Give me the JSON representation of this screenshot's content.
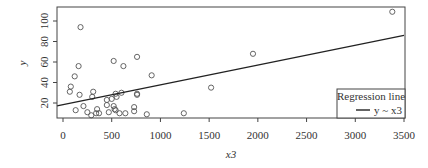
{
  "chart_data": {
    "type": "scatter",
    "title": "",
    "xlabel": "x3",
    "ylabel": "y",
    "xlim": [
      -100,
      3520
    ],
    "ylim": [
      4,
      113
    ],
    "xticks": [
      0,
      500,
      1000,
      1500,
      2000,
      2500,
      3000,
      3500
    ],
    "yticks": [
      20,
      40,
      60,
      80,
      100
    ],
    "grid": false,
    "legend": {
      "title": "Regression line",
      "entries": [
        "y ~ x3"
      ],
      "position": "bottom-right"
    },
    "regression_line": {
      "x": [
        -100,
        3500
      ],
      "y": [
        16.5,
        86
      ]
    },
    "points": [
      {
        "x": 180,
        "y": 94
      },
      {
        "x": 160,
        "y": 56
      },
      {
        "x": 120,
        "y": 46
      },
      {
        "x": 80,
        "y": 36
      },
      {
        "x": 70,
        "y": 31
      },
      {
        "x": 170,
        "y": 28
      },
      {
        "x": 130,
        "y": 13
      },
      {
        "x": 210,
        "y": 17
      },
      {
        "x": 250,
        "y": 11
      },
      {
        "x": 290,
        "y": 8
      },
      {
        "x": 310,
        "y": 31
      },
      {
        "x": 300,
        "y": 26
      },
      {
        "x": 340,
        "y": 10
      },
      {
        "x": 350,
        "y": 14
      },
      {
        "x": 370,
        "y": 10
      },
      {
        "x": 450,
        "y": 23
      },
      {
        "x": 450,
        "y": 18
      },
      {
        "x": 470,
        "y": 11
      },
      {
        "x": 500,
        "y": 24
      },
      {
        "x": 520,
        "y": 61
      },
      {
        "x": 520,
        "y": 17
      },
      {
        "x": 530,
        "y": 14
      },
      {
        "x": 540,
        "y": 13
      },
      {
        "x": 540,
        "y": 29
      },
      {
        "x": 550,
        "y": 26
      },
      {
        "x": 580,
        "y": 10
      },
      {
        "x": 600,
        "y": 30
      },
      {
        "x": 620,
        "y": 56
      },
      {
        "x": 640,
        "y": 10
      },
      {
        "x": 730,
        "y": 16
      },
      {
        "x": 730,
        "y": 12
      },
      {
        "x": 760,
        "y": 65
      },
      {
        "x": 760,
        "y": 28
      },
      {
        "x": 760,
        "y": 29
      },
      {
        "x": 860,
        "y": 9
      },
      {
        "x": 910,
        "y": 47
      },
      {
        "x": 1240,
        "y": 10
      },
      {
        "x": 1520,
        "y": 35
      },
      {
        "x": 1950,
        "y": 68
      },
      {
        "x": 3380,
        "y": 109
      }
    ]
  }
}
